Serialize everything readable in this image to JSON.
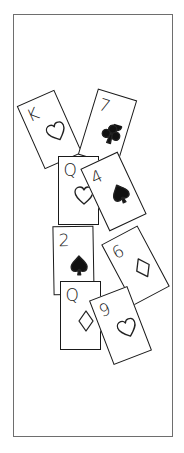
{
  "frame": {
    "border_color": "#6e6e6e"
  },
  "cards": [
    {
      "rank": "K",
      "suit": "hearts",
      "filled": false,
      "cx": 49,
      "cy": 129,
      "rot": -24
    },
    {
      "rank": "7",
      "suit": "clubs",
      "filled": true,
      "cx": 107,
      "cy": 127,
      "rot": 17
    },
    {
      "rank": "Q",
      "suit": "hearts",
      "filled": false,
      "cx": 78,
      "cy": 190,
      "rot": 0
    },
    {
      "rank": "4",
      "suit": "spades",
      "filled": true,
      "cx": 113,
      "cy": 191,
      "rot": -25
    },
    {
      "rank": "6",
      "suit": "diamonds",
      "filled": false,
      "cx": 135,
      "cy": 265,
      "rot": -28
    },
    {
      "rank": "2",
      "suit": "spades",
      "filled": true,
      "cx": 73,
      "cy": 260,
      "rot": -1
    },
    {
      "rank": "Q",
      "suit": "diamonds",
      "filled": false,
      "cx": 80,
      "cy": 315,
      "rot": 0
    },
    {
      "rank": "9",
      "suit": "hearts",
      "filled": false,
      "cx": 120,
      "cy": 325,
      "rot": -21
    }
  ]
}
